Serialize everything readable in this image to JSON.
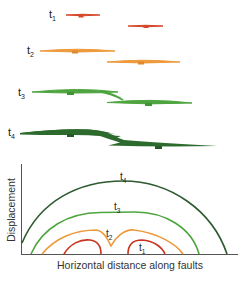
{
  "figure": {
    "stages": [
      {
        "label": "t",
        "sub": "1",
        "color": "#d6472a"
      },
      {
        "label": "t",
        "sub": "2",
        "color": "#ee9a3b"
      },
      {
        "label": "t",
        "sub": "3",
        "color": "#4ea53f"
      },
      {
        "label": "t",
        "sub": "4",
        "color": "#2d6a2e"
      }
    ],
    "plot": {
      "ylabel": "Displacement",
      "xlabel": "Horizontal distance along faults",
      "curve_labels": [
        {
          "label": "t",
          "sub": "4"
        },
        {
          "label": "t",
          "sub": "3"
        },
        {
          "label": "t",
          "sub": "2"
        },
        {
          "label": "t",
          "sub": "1"
        }
      ],
      "colors": {
        "t1": "#c8331f",
        "t2": "#ee9a3b",
        "t3": "#4ea53f",
        "t4": "#2d5a2e",
        "axis": "#555555"
      }
    }
  }
}
